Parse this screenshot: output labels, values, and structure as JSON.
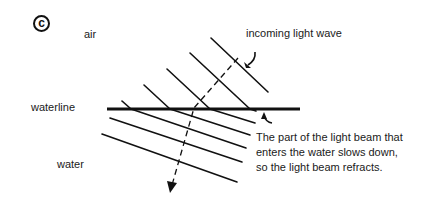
{
  "figure": {
    "panel_label": "c",
    "labels": {
      "air": "air",
      "incoming": "incoming light wave",
      "waterline": "waterline",
      "water": "water"
    },
    "caption_lines": [
      "The part of the light beam that",
      "enters the water slows down,",
      "so the light beam refracts."
    ],
    "colors": {
      "line": "#111111",
      "background": "#ffffff"
    }
  }
}
